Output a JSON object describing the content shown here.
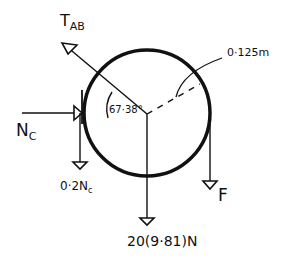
{
  "diagram": {
    "type": "free-body-diagram",
    "body": "disk",
    "forces": {
      "tension": {
        "label_main": "T",
        "label_sub": "AB"
      },
      "normal": {
        "label_main": "N",
        "label_sub": "C"
      },
      "friction": {
        "label_prefix": "0·2",
        "label_main": "N",
        "label_sub": "c"
      },
      "weight": {
        "label": "20(9·81)N"
      },
      "applied": {
        "label": "F"
      }
    },
    "angle": {
      "label": "67·38°"
    },
    "radius": {
      "label": "0·125m"
    },
    "colors": {
      "ink": "#111111",
      "background": "#ffffff"
    }
  }
}
